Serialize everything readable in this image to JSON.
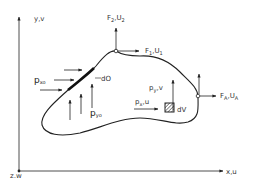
{
  "diagram": {
    "colors": {
      "ink": "#222222",
      "background": "#ffffff"
    },
    "axes": {
      "y_label": "y,v",
      "x_label": "x,u",
      "z_label": "z,w"
    },
    "forces": {
      "f2": {
        "main": "F",
        "sub": "2",
        "sep": ",U",
        "sub2": "2"
      },
      "f1": {
        "main": "F",
        "sub": "1",
        "sep": ",U",
        "sub2": "1"
      },
      "fa": {
        "main": "F",
        "sub": "A",
        "sep": ",U",
        "sub2": "A"
      }
    },
    "surface_loads": {
      "pxo": {
        "main": "p",
        "sub": "xo"
      },
      "pyo": {
        "main": "p",
        "sub": "yo"
      },
      "d0": "dO"
    },
    "volume_loads": {
      "py": {
        "main": "p",
        "sub": "y",
        "rest": ",v"
      },
      "px": {
        "main": "p",
        "sub": "x",
        "rest": ",u"
      },
      "dv": "dV"
    }
  }
}
